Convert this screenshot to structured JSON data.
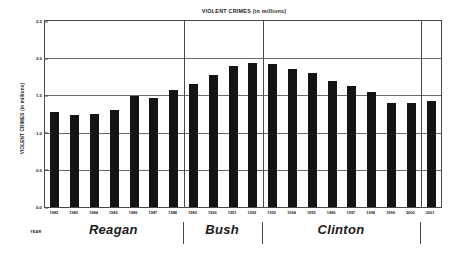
{
  "chart_data": {
    "type": "bar",
    "title": "VIOLENT CRIMES (in millions)",
    "xlabel": "YEAR",
    "ylabel": "VIOLENT CRIMES (in millions)",
    "ylim": [
      0.0,
      2.5
    ],
    "yticks": [
      "0.0",
      "0.5",
      "1.0",
      "1.5",
      "2.0",
      "2.5"
    ],
    "ytick_values": [
      0.0,
      0.5,
      1.0,
      1.5,
      2.0,
      2.5
    ],
    "grid": true,
    "legend": "none",
    "bar_color": "#141414",
    "categories": [
      "1982",
      "1983",
      "1984",
      "1985",
      "1986",
      "1987",
      "1988",
      "1989",
      "1990",
      "1991",
      "1992",
      "1993",
      "1994",
      "1995",
      "1996",
      "1997",
      "1998",
      "1999",
      "2000",
      "2001"
    ],
    "values": [
      1.28,
      1.24,
      1.25,
      1.3,
      1.49,
      1.47,
      1.57,
      1.65,
      1.77,
      1.9,
      1.93,
      1.92,
      1.86,
      1.8,
      1.69,
      1.63,
      1.55,
      1.4,
      1.4,
      1.43
    ],
    "annotations": [
      {
        "label": "Reagan",
        "start": "1982",
        "end": "1988"
      },
      {
        "label": "Bush",
        "start": "1989",
        "end": "1992"
      },
      {
        "label": "Clinton",
        "start": "1993",
        "end": "2000"
      }
    ],
    "era_dividers_after": [
      "1988",
      "1992",
      "2000"
    ]
  },
  "eras": [
    {
      "label": "Reagan"
    },
    {
      "label": "Bush"
    },
    {
      "label": "Clinton"
    }
  ],
  "axis": {
    "year_caption": "YEAR"
  }
}
